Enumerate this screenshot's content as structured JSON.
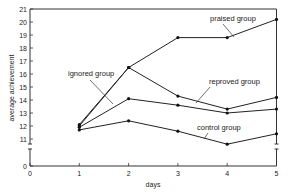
{
  "chart_data": {
    "type": "line",
    "title": "",
    "xlabel": "days",
    "ylabel": "average achievement",
    "x": [
      1,
      2,
      3,
      4,
      5
    ],
    "x_ticks": [
      0,
      1,
      2,
      3,
      4,
      5
    ],
    "y_ticks": [
      0,
      11,
      12,
      13,
      14,
      15,
      16,
      17,
      18,
      19,
      20,
      21
    ],
    "ylim": [
      0,
      21
    ],
    "y_axis_break": [
      0,
      11
    ],
    "grid": false,
    "legend": "none (direct labels)",
    "series": [
      {
        "name": "praised group",
        "values": [
          12.0,
          16.5,
          18.8,
          18.8,
          20.2
        ]
      },
      {
        "name": "reproved group",
        "values": [
          12.1,
          16.5,
          14.3,
          13.3,
          14.2
        ]
      },
      {
        "name": "ignored group",
        "values": [
          11.9,
          14.1,
          13.6,
          13.0,
          13.3
        ]
      },
      {
        "name": "control group",
        "values": [
          11.7,
          12.4,
          11.6,
          10.6,
          11.4
        ]
      }
    ],
    "annotations": [
      "praised group",
      "ignored group",
      "reproved group",
      "control group"
    ]
  },
  "labels": {
    "xlabel": "days",
    "ylabel": "average achievement",
    "praised": "praised group",
    "ignored": "ignored group",
    "reproved": "reproved group",
    "control": "control group"
  }
}
